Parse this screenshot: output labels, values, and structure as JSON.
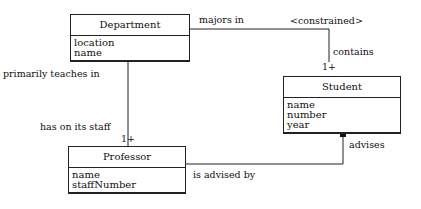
{
  "diagram": {
    "type": "UML class diagram",
    "classes": {
      "department": {
        "name": "Department",
        "attributes": [
          "location",
          "name"
        ]
      },
      "student": {
        "name": "Student",
        "attributes": [
          "name",
          "number",
          "year"
        ]
      },
      "professor": {
        "name": "Professor",
        "attributes": [
          "name",
          "staffNumber"
        ]
      }
    },
    "associations": {
      "majors": {
        "label_from": "majors in",
        "constraint": "<constrained>",
        "label_to": "contains",
        "multiplicity": "1+"
      },
      "teaches": {
        "label_from": "primarily teaches in",
        "label_to": "has on its staff",
        "multiplicity": "1+"
      },
      "advises": {
        "label_from": "is advised by",
        "label_to": "advises"
      }
    },
    "line_color": "#222222"
  }
}
